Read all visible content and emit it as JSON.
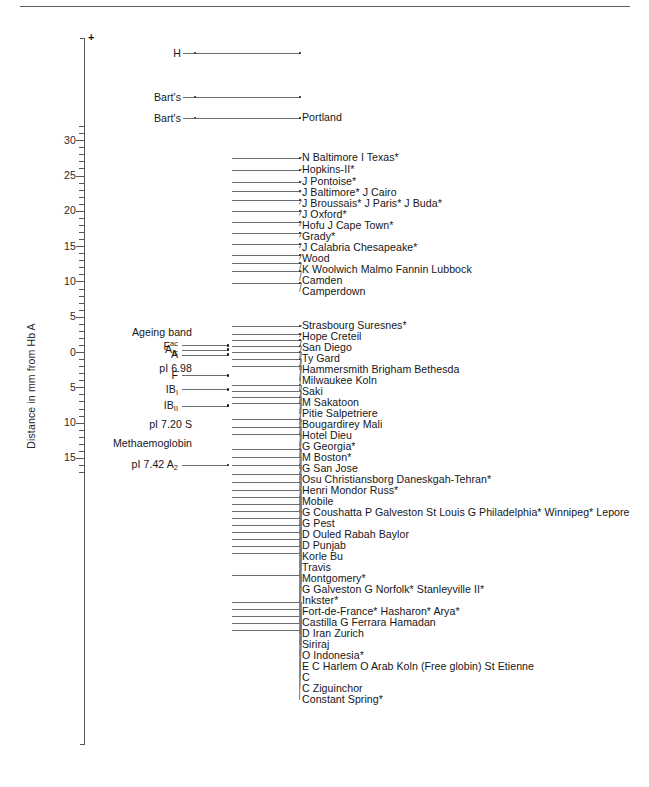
{
  "figure": {
    "type": "isoelectric-focusing-band-map",
    "y_axis_label": "Distance in mm from Hb A",
    "polarity_marker": "+",
    "axis": {
      "major_ticks": [
        30,
        25,
        20,
        15,
        10,
        5,
        0,
        5,
        10,
        15
      ],
      "major_values": [
        30,
        25,
        20,
        15,
        10,
        5,
        0,
        -5,
        -10,
        -15
      ],
      "minor_step": 1,
      "top_value": 31.5,
      "bottom_value": -17,
      "pixels_per_unit": 7.06,
      "zero_y_px": 352
    }
  },
  "left_markers": [
    {
      "text": "Ageing band",
      "html": "Ageing band",
      "value": 2.7,
      "stem": false
    },
    {
      "text": "Fac",
      "html": "F<sup>ac</sup>",
      "value": 0.95,
      "stem": true
    },
    {
      "text": "AIc",
      "html": "A<sub>Ic</sub>",
      "value": 0.35,
      "stem": true
    },
    {
      "text": "A",
      "html": "A",
      "value": -0.35,
      "stem": true
    },
    {
      "text": "pI 6.98",
      "html": "pI 6.98",
      "value": -2.4,
      "stem": false
    },
    {
      "text": "F",
      "html": "F",
      "value": -3.3,
      "stem": true
    },
    {
      "text": "IBI",
      "html": "IB<sub>I</sub>",
      "value": -5.3,
      "stem": true
    },
    {
      "text": "IBII",
      "html": "IB<sub>II</sub>",
      "value": -7.6,
      "stem": true
    },
    {
      "text": "pI 7.20 S",
      "html": "pI 7.20 S",
      "value": -10.2,
      "stem": false
    },
    {
      "text": "Methaemoglobin",
      "html": "Methaemoglobin",
      "value": -13.0,
      "stem": false
    },
    {
      "text": "pI 7.42 A2",
      "html": "pI 7.42 A<sub>2</sub>",
      "value": -16.0,
      "stem": true
    }
  ],
  "bands": [
    {
      "label": "H",
      "value": 30.0,
      "side": "left",
      "x0": 195,
      "x1": 300
    },
    {
      "label": "Bart's",
      "value": 23.7,
      "side": "left",
      "x0": 195,
      "x1": 300
    },
    {
      "label": "Bart's",
      "value": 20.7,
      "side": "left",
      "x0": 195,
      "x1": 300,
      "right_label": "Portland"
    },
    {
      "label": "N Baltimore I Texas*",
      "value": 11.9,
      "side": "right",
      "x0": 232,
      "x1": 300
    },
    {
      "label": "Hopkins-II*",
      "value": 10.8,
      "side": "right",
      "x0": 232,
      "x1": 300
    },
    {
      "label": "J Pontoise*",
      "value": 9.7,
      "side": "right",
      "x0": 232,
      "x1": 300
    },
    {
      "label": "J Baltimore* J Cairo",
      "value": 8.9,
      "side": "right",
      "x0": 232,
      "x1": 300
    },
    {
      "label": "J Broussais* J Paris* J Buda*",
      "value": 8.1,
      "side": "right",
      "x0": 232,
      "x1": 300
    },
    {
      "label": "J Oxford*",
      "value": 7.2,
      "side": "right",
      "x0": 232,
      "x1": 300
    },
    {
      "label": "Hofu J Cape Town*",
      "value": 6.4,
      "side": "right",
      "x0": 232,
      "x1": 300
    },
    {
      "label": "Grady*",
      "value": 5.6,
      "side": "right",
      "x0": 232,
      "x1": 300
    },
    {
      "label": "J Calabria Chesapeake*",
      "value": 4.8,
      "side": "right",
      "x0": 232,
      "x1": 300
    },
    {
      "label": "Wood",
      "value": 4.0,
      "side": "right",
      "x0": 232,
      "x1": 300
    },
    {
      "label": "K Woolwich Malmo Fannin Lubbock",
      "value": 3.2,
      "side": "right",
      "x0": 232,
      "x1": 300
    },
    {
      "label": "Camden",
      "value": 2.5,
      "side": "right",
      "x0": 232,
      "x1": 300
    },
    {
      "label": "Camperdown",
      "value": 1.7,
      "side": "right",
      "x0": 232,
      "x1": 300
    },
    {
      "label": "Strasbourg Suresnes*",
      "value": 0.95,
      "side": "right",
      "x0": 232,
      "x1": 300
    },
    {
      "label": "Hope Creteil",
      "value": 0.35,
      "side": "right",
      "x0": 232,
      "x1": 300
    },
    {
      "label": "San Diego",
      "value": -0.2,
      "side": "right",
      "x0": 232,
      "x1": 300
    },
    {
      "label": "Ty Gard",
      "value": -0.7,
      "side": "right",
      "x0": 232,
      "x1": 300
    },
    {
      "label": "Hammersmith Brigham Bethesda",
      "value": -1.2,
      "side": "right",
      "x0": 232,
      "x1": 300
    },
    {
      "label": "Milwaukee Koln",
      "value": -1.7,
      "side": "right",
      "x0": 232,
      "x1": 300
    },
    {
      "label": "Saki",
      "value": -2.2,
      "side": "right",
      "x0": 232,
      "x1": 300
    },
    {
      "label": "M Sakatoon",
      "value": -3.0,
      "side": "right",
      "x0": 232,
      "x1": 300
    },
    {
      "label": "Pitie Salpetriere",
      "value": -3.4,
      "side": "right",
      "x0": 232,
      "x1": 300
    },
    {
      "label": "Bougardirey Mali",
      "value": -3.8,
      "side": "right",
      "x0": 232,
      "x1": 300
    },
    {
      "label": "Hotel Dieu",
      "value": -4.2,
      "side": "right",
      "x0": 232,
      "x1": 300
    },
    {
      "label": "G Georgia*",
      "value": -5.3,
      "side": "right",
      "x0": 232,
      "x1": 300
    },
    {
      "label": "M Boston*",
      "value": -5.9,
      "side": "right",
      "x0": 232,
      "x1": 300
    },
    {
      "label": "G San Jose",
      "value": -6.4,
      "side": "right",
      "x0": 232,
      "x1": 300
    },
    {
      "label": "Osu Christiansborg Daneskgah-Tehran*",
      "value": -7.1,
      "side": "right",
      "x0": 232,
      "x1": 300
    },
    {
      "label": "Henri Mondor Russ*",
      "value": -7.7,
      "side": "right",
      "x0": 232,
      "x1": 300
    },
    {
      "label": "Mobile",
      "value": -8.3,
      "side": "right",
      "x0": 232,
      "x1": 300
    },
    {
      "label": "G Coushatta P Galveston St Louis G Philadelphia* Winnipeg* Lepore",
      "value": -8.9,
      "side": "right",
      "x0": 232,
      "x1": 300
    },
    {
      "label": "G Pest",
      "value": -9.5,
      "side": "right",
      "x0": 232,
      "x1": 300
    },
    {
      "label": "D Ouled Rabah Baylor",
      "value": -10.1,
      "side": "right",
      "x0": 232,
      "x1": 300
    },
    {
      "label": "D Punjab",
      "value": -10.6,
      "side": "right",
      "x0": 232,
      "x1": 300
    },
    {
      "label": "Korle Bu",
      "value": -11.1,
      "side": "right",
      "x0": 232,
      "x1": 300
    },
    {
      "label": "Travis",
      "value": -11.6,
      "side": "right",
      "x0": 232,
      "x1": 300
    },
    {
      "label": "Montgomery*",
      "value": -12.1,
      "side": "right",
      "x0": 232,
      "x1": 300
    },
    {
      "label": "G Galveston G Norfolk* Stanleyville II*",
      "value": -12.6,
      "side": "right",
      "x0": 232,
      "x1": 300
    },
    {
      "label": "Inkster*",
      "value": -13.1,
      "side": "right",
      "x0": 232,
      "x1": 300
    },
    {
      "label": "Fort-de-France* Hasharon* Arya*",
      "value": -13.6,
      "side": "right",
      "x0": 232,
      "x1": 300
    },
    {
      "label": "Castilla G Ferrara Hamadan",
      "value": -14.1,
      "side": "right",
      "x0": 232,
      "x1": 300
    },
    {
      "label": "D Iran Zurich",
      "value": -14.6,
      "side": "right",
      "x0": 232,
      "x1": 300
    },
    {
      "label": "Siriraj",
      "value": -15.6,
      "side": "right",
      "x0": 232,
      "x1": 300
    },
    {
      "label": "O Indonesia*",
      "value": -16.2,
      "side": "right",
      "x0": 232,
      "x1": 300
    },
    {
      "label": "E C Harlem O Arab Koln (Free globin) St Etienne",
      "value": -16.7,
      "side": "right",
      "x0": 232,
      "x1": 300
    },
    {
      "label": "C",
      "value": -17.2,
      "side": "right",
      "x0": 232,
      "x1": 300
    },
    {
      "label": "C Ziguinchor",
      "value": -17.7,
      "side": "right",
      "x0": 232,
      "x1": 300
    },
    {
      "label": "Constant Spring*",
      "value": -18.2,
      "side": "right",
      "x0": 232,
      "x1": 300
    }
  ],
  "geometry": {
    "note": "rows are drawn from explicit pixel y in rows_px; values above are the scale reading",
    "rows_px": [
      53,
      97,
      118,
      158,
      170,
      182,
      191,
      200,
      211,
      222,
      233,
      244,
      255,
      263,
      271,
      283,
      326,
      334,
      340,
      346,
      352,
      359,
      366,
      385,
      391,
      397,
      403,
      419,
      427,
      434,
      449,
      457,
      465,
      474,
      482,
      490,
      497,
      504,
      511,
      518,
      525,
      532,
      539,
      546,
      553,
      575,
      602,
      609,
      616,
      623,
      630
    ],
    "bar_left": 232,
    "bar_left_wide": 195,
    "bar_right": 300,
    "label_x": 302
  }
}
